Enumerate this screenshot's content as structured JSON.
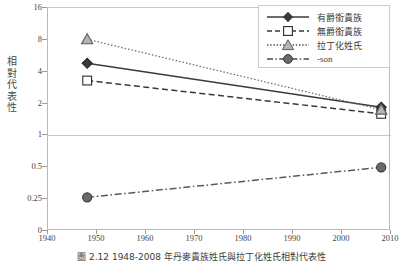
{
  "chart_data": {
    "type": "line",
    "title": "",
    "caption": "圖 2.12   1948-2008 年丹麥貴族姓氏與拉丁化姓氏相對代表性",
    "xlabel": "",
    "ylabel": "相對代表性",
    "x": [
      1948,
      2008
    ],
    "xlim": [
      1940,
      2010
    ],
    "xticks": [
      1940,
      1950,
      1960,
      1970,
      1980,
      1990,
      2000,
      2010
    ],
    "yticks": [
      0,
      0.25,
      0.5,
      1,
      2,
      4,
      8,
      16
    ],
    "ytick_labels": [
      "0",
      "0.25",
      "0.5",
      "1",
      "2",
      "4",
      "8",
      "16"
    ],
    "yscale": "log2-like-ordinal",
    "ylim": [
      0,
      16
    ],
    "gridlines": [
      "1"
    ],
    "legend_position": "top-right",
    "series": [
      {
        "name": "有爵銜貴族",
        "marker": "diamond",
        "linestyle": "solid",
        "color": "#3a3a3a",
        "values": [
          4.8,
          1.85
        ]
      },
      {
        "name": "無爵銜貴族",
        "marker": "square",
        "linestyle": "dashed",
        "color": "#3a3a3a",
        "values": [
          3.3,
          1.6
        ]
      },
      {
        "name": "拉丁化姓氏",
        "marker": "triangle",
        "linestyle": "dotted",
        "color": "#6f6f6f",
        "values": [
          8.1,
          1.75
        ]
      },
      {
        "name": "-son",
        "marker": "circle",
        "linestyle": "dashdot",
        "color": "#5a5a5a",
        "values": [
          0.26,
          0.5
        ]
      }
    ]
  },
  "axes": {
    "y_title_chars": [
      "相",
      "對",
      "代",
      "表",
      "性"
    ],
    "y_labels": [
      "16",
      "8",
      "4",
      "2",
      "1",
      "0.5",
      "0.25",
      "0"
    ],
    "x_labels": [
      "1940",
      "1950",
      "1960",
      "1970",
      "1980",
      "1990",
      "2000",
      "2010"
    ]
  },
  "legend": {
    "items": [
      {
        "label": "有爵銜貴族",
        "key": "diamond-solid-key"
      },
      {
        "label": "無爵銜貴族",
        "key": "square-dashed-key"
      },
      {
        "label": "拉丁化姓氏",
        "key": "triangle-dotted-key"
      },
      {
        "label": "-son",
        "key": "circle-dashdot-key"
      }
    ]
  },
  "colors": {
    "axis": "#9a9a9a",
    "frame": "#b9b9b9",
    "gridline": "#c4c4c4",
    "series_dark": "#3a3a3a",
    "series_mid": "#5a5a5a",
    "series_light": "#6f6f6f",
    "marker_fill_light": "#b5b5b5",
    "text": "#3d3d3d",
    "background": "#ffffff"
  }
}
